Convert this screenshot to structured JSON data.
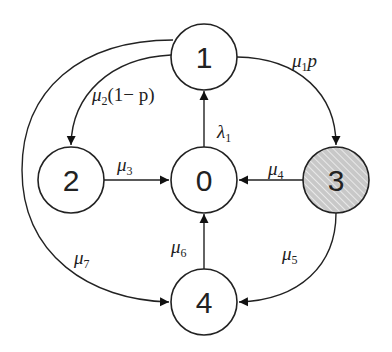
{
  "diagram": {
    "type": "state-transition",
    "nodes": [
      {
        "id": "0",
        "label": "0",
        "fill": "#ffffff",
        "hatched": false
      },
      {
        "id": "1",
        "label": "1",
        "fill": "#ffffff",
        "hatched": false
      },
      {
        "id": "2",
        "label": "2",
        "fill": "#ffffff",
        "hatched": false
      },
      {
        "id": "3",
        "label": "3",
        "fill": "#d0d0d0",
        "hatched": true
      },
      {
        "id": "4",
        "label": "4",
        "fill": "#ffffff",
        "hatched": false
      }
    ],
    "edges": [
      {
        "from": "0",
        "to": "1",
        "symbol": "λ",
        "sub": "1",
        "suffix": ""
      },
      {
        "from": "1",
        "to": "2",
        "symbol": "μ",
        "sub": "2",
        "suffix": "(1− p)"
      },
      {
        "from": "1",
        "to": "3",
        "symbol": "μ",
        "sub": "1",
        "suffix": "p"
      },
      {
        "from": "2",
        "to": "0",
        "symbol": "μ",
        "sub": "3",
        "suffix": ""
      },
      {
        "from": "3",
        "to": "0",
        "symbol": "μ",
        "sub": "4",
        "suffix": ""
      },
      {
        "from": "3",
        "to": "4",
        "symbol": "μ",
        "sub": "5",
        "suffix": ""
      },
      {
        "from": "4",
        "to": "0",
        "symbol": "μ",
        "sub": "6",
        "suffix": ""
      },
      {
        "from": "1",
        "to": "4",
        "symbol": "μ",
        "sub": "7",
        "suffix": ""
      }
    ]
  }
}
